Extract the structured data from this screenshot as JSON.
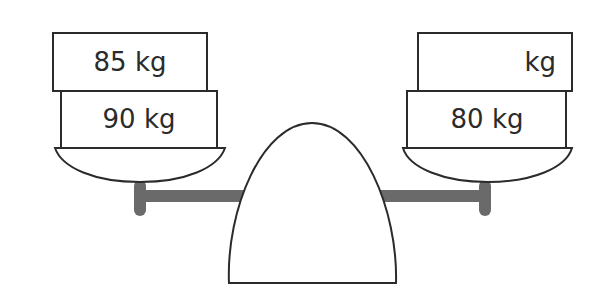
{
  "diagram": {
    "type": "balance-scale",
    "colors": {
      "stroke": "#2b2b2b",
      "beam": "#6a6a6a",
      "fill": "#ffffff"
    },
    "left_pan": {
      "weights": [
        {
          "label": "85 kg",
          "position": "top"
        },
        {
          "label": "90 kg",
          "position": "bottom"
        }
      ]
    },
    "right_pan": {
      "weights": [
        {
          "label": "kg",
          "position": "top",
          "value_missing": true
        },
        {
          "label": "80 kg",
          "position": "bottom"
        }
      ]
    }
  }
}
